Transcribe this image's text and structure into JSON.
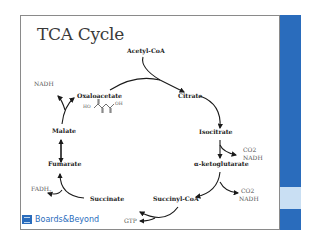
{
  "slide": {
    "title": "TCA Cycle",
    "brand": "Boards&Beyond",
    "accent_color": "#2a6cbc",
    "accent_light_color": "#c9dff3"
  },
  "cycle": {
    "input": "Acetyl-CoA",
    "nodes": [
      {
        "id": "citrate",
        "label": "Citrate"
      },
      {
        "id": "isocitrate",
        "label": "Isocitrate"
      },
      {
        "id": "akg",
        "label": "α-ketoglutarate"
      },
      {
        "id": "succinylcoa",
        "label": "Succinyl-CoA"
      },
      {
        "id": "succinate",
        "label": "Succinate"
      },
      {
        "id": "fumarate",
        "label": "Fumarate"
      },
      {
        "id": "malate",
        "label": "Malate"
      },
      {
        "id": "oxaloacetate",
        "label": "Oxaloacetate"
      }
    ],
    "byproducts": {
      "isocitrate_co2": "CO2",
      "isocitrate_nadh": "NADH",
      "akg_co2": "CO2",
      "akg_nadh": "NADH",
      "succinyl_gtp": "GTP",
      "succinate_fadh2": "FADH",
      "succinate_fadh2_sub": "2",
      "malate_nadh": "NADH"
    },
    "oxaloacetate_structure": {
      "left_group": "HO",
      "right_group": "OH"
    }
  }
}
